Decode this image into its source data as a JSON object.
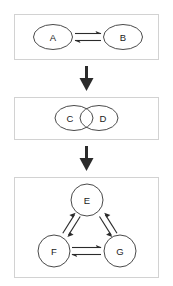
{
  "diagram": {
    "background_color": "#ffffff",
    "panel_border_color": "#d2d2d2",
    "node_stroke_color": "#4a4a4a",
    "arrow_color": "#2b2b2b",
    "label_color": "#1a1a1a",
    "panels": [
      {
        "id": "panel-top",
        "layout": "pair-horizontal",
        "nodes": [
          {
            "id": "node-a",
            "label": "A"
          },
          {
            "id": "node-b",
            "label": "B"
          }
        ],
        "connectors": [
          {
            "id": "connector-a-b",
            "type": "reversible-double-arrow",
            "from": "A",
            "to": "B",
            "orientation": "horizontal"
          }
        ]
      },
      {
        "id": "panel-middle",
        "layout": "overlapping-pair",
        "nodes": [
          {
            "id": "node-c",
            "label": "C"
          },
          {
            "id": "node-d",
            "label": "D"
          }
        ],
        "connectors": []
      },
      {
        "id": "panel-bottom",
        "layout": "triangle",
        "nodes": [
          {
            "id": "node-e",
            "label": "E"
          },
          {
            "id": "node-f",
            "label": "F"
          },
          {
            "id": "node-g",
            "label": "G"
          }
        ],
        "connectors": [
          {
            "id": "connector-e-f",
            "type": "reversible-double-arrow",
            "from": "E",
            "to": "F",
            "orientation": "diagonal-left"
          },
          {
            "id": "connector-e-g",
            "type": "reversible-double-arrow",
            "from": "E",
            "to": "G",
            "orientation": "diagonal-right"
          },
          {
            "id": "connector-f-g",
            "type": "reversible-double-arrow",
            "from": "F",
            "to": "G",
            "orientation": "horizontal"
          }
        ]
      }
    ],
    "flow_arrows": [
      {
        "id": "flow-arrow-1",
        "direction": "down",
        "from_panel": "panel-top",
        "to_panel": "panel-middle"
      },
      {
        "id": "flow-arrow-2",
        "direction": "down",
        "from_panel": "panel-middle",
        "to_panel": "panel-bottom"
      }
    ]
  }
}
